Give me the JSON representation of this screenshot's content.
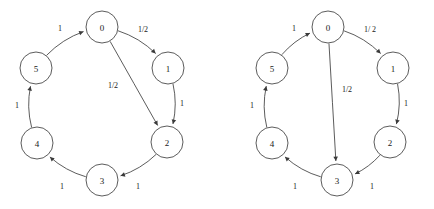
{
  "figure": {
    "title": "",
    "background_color": "#ffffff",
    "stroke_color": "#4a4a4a",
    "text_color": "#1a1a1a",
    "width": 434,
    "height": 209
  },
  "chart_data": {
    "type": "diagram",
    "subtype": "state-transition-graph",
    "title": "",
    "xlabel": "",
    "ylabel": "",
    "panels": [
      {
        "id": "left",
        "name": "left-diagram",
        "nodes": [
          {
            "id": "0",
            "label": "0",
            "cx": 102,
            "cy": 27,
            "r": 16
          },
          {
            "id": "1",
            "label": "1",
            "cx": 168,
            "cy": 68,
            "r": 16
          },
          {
            "id": "2",
            "label": "2",
            "cx": 167,
            "cy": 142,
            "r": 16
          },
          {
            "id": "3",
            "label": "3",
            "cx": 102,
            "cy": 180,
            "r": 16
          },
          {
            "id": "4",
            "label": "4",
            "cx": 37,
            "cy": 143,
            "r": 16
          },
          {
            "id": "5",
            "label": "5",
            "cx": 36,
            "cy": 68,
            "r": 16
          }
        ],
        "edges": [
          {
            "from": "5",
            "to": "0",
            "label": "1",
            "label_x": 60,
            "label_y": 28
          },
          {
            "from": "0",
            "to": "1",
            "label": "1/2",
            "label_x": 143,
            "label_y": 29
          },
          {
            "from": "0",
            "to": "2",
            "label": "1/2",
            "label_x": 113,
            "label_y": 85
          },
          {
            "from": "1",
            "to": "2",
            "label": "1",
            "label_x": 182,
            "label_y": 103
          },
          {
            "from": "2",
            "to": "3",
            "label": "1",
            "label_x": 138,
            "label_y": 186
          },
          {
            "from": "3",
            "to": "4",
            "label": "1",
            "label_x": 62,
            "label_y": 186
          },
          {
            "from": "4",
            "to": "5",
            "label": "1",
            "label_x": 17,
            "label_y": 105
          }
        ]
      },
      {
        "id": "right",
        "name": "right-diagram",
        "nodes": [
          {
            "id": "0",
            "label": "0",
            "cx": 328,
            "cy": 27,
            "r": 16
          },
          {
            "id": "1",
            "label": "1",
            "cx": 393,
            "cy": 68,
            "r": 16
          },
          {
            "id": "2",
            "label": "2",
            "cx": 390,
            "cy": 142,
            "r": 16
          },
          {
            "id": "3",
            "label": "3",
            "cx": 337,
            "cy": 180,
            "r": 16
          },
          {
            "id": "4",
            "label": "4",
            "cx": 272,
            "cy": 143,
            "r": 16
          },
          {
            "id": "5",
            "label": "5",
            "cx": 272,
            "cy": 68,
            "r": 16
          }
        ],
        "edges": [
          {
            "from": "5",
            "to": "0",
            "label": "1",
            "label_x": 294,
            "label_y": 28
          },
          {
            "from": "0",
            "to": "1",
            "label": "1/ 2",
            "label_x": 370,
            "label_y": 29
          },
          {
            "from": "0",
            "to": "3",
            "label": "1/2",
            "label_x": 347,
            "label_y": 89
          },
          {
            "from": "1",
            "to": "2",
            "label": "1",
            "label_x": 406,
            "label_y": 103
          },
          {
            "from": "2",
            "to": "3",
            "label": "1",
            "label_x": 372,
            "label_y": 186
          },
          {
            "from": "3",
            "to": "4",
            "label": "1",
            "label_x": 295,
            "label_y": 186
          },
          {
            "from": "4",
            "to": "5",
            "label": "1",
            "label_x": 252,
            "label_y": 105
          }
        ]
      }
    ]
  }
}
